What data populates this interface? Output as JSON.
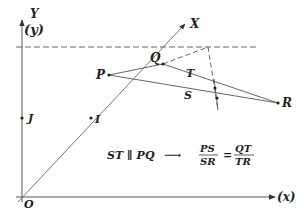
{
  "diagram": {
    "axes": {
      "y_label": "Y",
      "y_paren_label": "(y)",
      "x_paren_label": "(x)",
      "oblique_label": "X",
      "origin_label": "O"
    },
    "points": {
      "P": "P",
      "Q": "Q",
      "R": "R",
      "S": "S",
      "T": "T",
      "I": "I",
      "J": "J"
    },
    "equation": {
      "lhs": "ST ∥ PQ",
      "arrow": "⟶",
      "frac1_num": "PS",
      "frac1_den": "SR",
      "equals": "=",
      "frac2_num": "QT",
      "frac2_den": "TR"
    },
    "colors": {
      "line": "#555555",
      "text": "#222222",
      "background": "#ffffff"
    }
  }
}
